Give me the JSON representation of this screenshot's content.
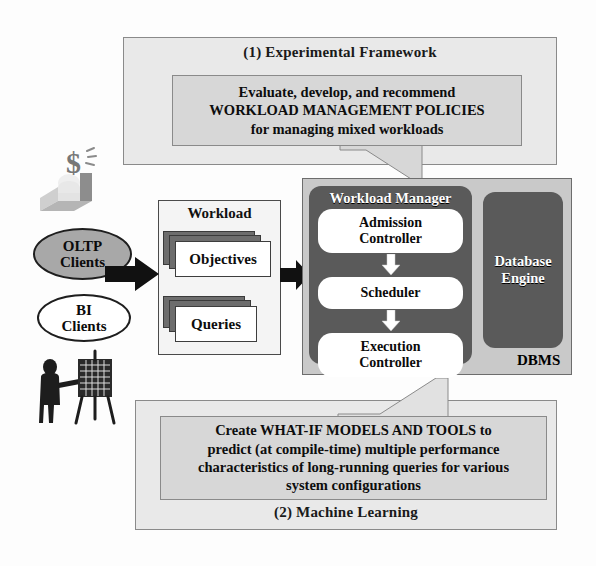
{
  "top_panel": {
    "label": "(1) Experimental Framework",
    "callout": {
      "lines": [
        "Evaluate, develop, and recommend",
        "WORKLOAD MANAGEMENT POLICIES",
        "for managing mixed workloads"
      ]
    }
  },
  "bottom_panel": {
    "label": "(2) Machine Learning",
    "callout": {
      "lines": [
        "Create WHAT-IF MODELS AND TOOLS to",
        "predict (at compile-time) multiple performance",
        "characteristics of long-running queries for various",
        "system configurations"
      ]
    }
  },
  "clients": {
    "oltp": {
      "line1": "OLTP",
      "line2": "Clients"
    },
    "bi": {
      "line1": "BI",
      "line2": "Clients"
    },
    "icons": {
      "money_user": "money-user-icon",
      "presenter": "presenter-easel-icon"
    }
  },
  "workload": {
    "title": "Workload",
    "items": [
      {
        "label": "Objectives"
      },
      {
        "label": "Queries"
      }
    ]
  },
  "flow": {
    "input_arrow": "right-arrow-icon"
  },
  "dbms": {
    "label": "DBMS",
    "workload_manager": {
      "title": "Workload Manager",
      "stages": [
        {
          "line1": "Admission",
          "line2": "Controller"
        },
        {
          "line1": "Scheduler",
          "line2": ""
        },
        {
          "line1": "Execution",
          "line2": "Controller"
        }
      ],
      "stage_arrows": [
        "down-arrow-icon",
        "down-arrow-icon"
      ]
    },
    "database_engine": {
      "line1": "Database",
      "line2": "Engine"
    }
  },
  "colors": {
    "panel_bg": "#e9e9e9",
    "callout_bg": "#d7d7d7",
    "dbms_bg": "#c9c9c9",
    "dark_box": "#5a5a5a",
    "oltp_fill": "#a8a8a8",
    "white": "#ffffff"
  }
}
